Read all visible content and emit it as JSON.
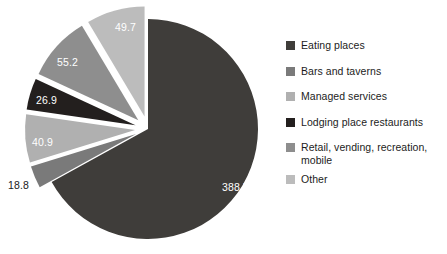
{
  "chart_data": {
    "type": "pie",
    "title": "",
    "categories": [
      "Eating places",
      "Bars and taverns",
      "Managed services",
      "Lodging place restaurants",
      "Retail, vending, recreation, mobile",
      "Other"
    ],
    "values": [
      388.5,
      18.8,
      40.9,
      26.9,
      55.2,
      49.7
    ],
    "value_labels": [
      "388.5",
      "18.8",
      "40.9",
      "26.9",
      "55.2",
      "49.7"
    ],
    "total": 580.0,
    "colors": [
      "#3f3d3a",
      "#7a7a7a",
      "#b0b0b0",
      "#231f1e",
      "#8e8e8e",
      "#bcbcbc"
    ],
    "exploded": [
      false,
      true,
      true,
      true,
      true,
      true
    ],
    "label_positions": [
      {
        "text": "388.5",
        "x": 222,
        "y": 182,
        "style": "inside"
      },
      {
        "text": "18.8",
        "x": 8,
        "y": 180,
        "style": "outside"
      },
      {
        "text": "40.9",
        "x": 32,
        "y": 137,
        "style": "inside"
      },
      {
        "text": "26.9",
        "x": 36,
        "y": 95,
        "style": "inside"
      },
      {
        "text": "55.2",
        "x": 57,
        "y": 57,
        "style": "inside"
      },
      {
        "text": "49.7",
        "x": 115,
        "y": 22,
        "style": "inside"
      }
    ],
    "legend_position": "right",
    "grid": false,
    "xlabel": "",
    "ylabel": ""
  },
  "legend": {
    "items": [
      {
        "label": "Eating places",
        "color": "#3f3d3a"
      },
      {
        "label": "Bars and taverns",
        "color": "#7a7a7a"
      },
      {
        "label": "Managed services",
        "color": "#b0b0b0"
      },
      {
        "label": "Lodging place restaurants",
        "color": "#231f1e"
      },
      {
        "label": "Retail, vending, recreation, mobile",
        "color": "#8e8e8e"
      },
      {
        "label": "Other",
        "color": "#bcbcbc"
      }
    ]
  }
}
